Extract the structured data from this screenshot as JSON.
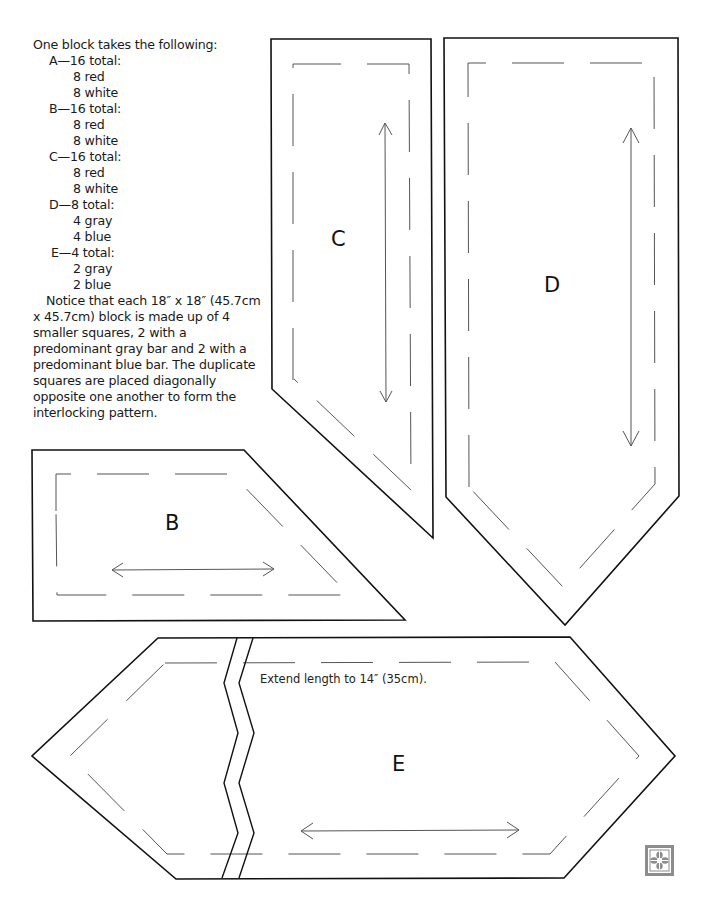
{
  "instructions": {
    "intro": "One block takes the following:",
    "pieces": [
      {
        "label": "A—16 total:",
        "items": [
          "8 red",
          "8 white"
        ]
      },
      {
        "label": "B—16 total:",
        "items": [
          "8 red",
          "8 white"
        ]
      },
      {
        "label": "C—16 total:",
        "items": [
          "8 red",
          "8 white"
        ]
      },
      {
        "label": "D—8 total:",
        "items": [
          "4 gray",
          "4 blue"
        ]
      },
      {
        "label": "E—4 total:",
        "items": [
          "2 gray",
          "2 blue"
        ]
      }
    ],
    "note": "Notice that each 18″ x 18″ (45.7cm x 45.7cm) block is made up of 4 smaller squares, 2 with a predominant gray bar and 2 with a predominant blue bar. The duplicate squares are placed diagonally opposite one another to form the interlocking pattern."
  },
  "pattern_pieces": {
    "b": {
      "label": "B",
      "grainline": "horizontal"
    },
    "c": {
      "label": "C",
      "grainline": "vertical"
    },
    "d": {
      "label": "D",
      "grainline": "vertical"
    },
    "e": {
      "label": "E",
      "grainline": "horizontal",
      "note": "Extend length to 14″ (35cm)."
    }
  },
  "colors": {
    "outline": "#111111",
    "seam_line": "#555555",
    "logo": "#8c8c8c"
  },
  "icons": {
    "logo": "quatrefoil-block-icon"
  }
}
